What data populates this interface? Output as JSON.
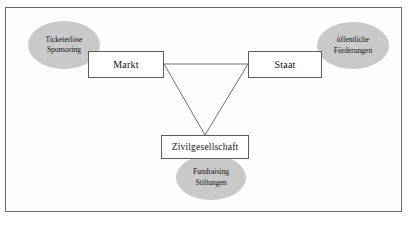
{
  "diagram": {
    "frame": {
      "border_color": "#6b6b6b",
      "background": "#fefefe"
    },
    "palette": {
      "ellipse_fill": "#c9c9c9",
      "box_stroke": "#5d5d5d",
      "box_fill": "#ffffff",
      "connector_stroke": "#6e6e6e",
      "text": "#111111"
    },
    "nodes": [
      {
        "id": "markt",
        "label": "Markt",
        "shape": "rectangle"
      },
      {
        "id": "staat",
        "label": "Staat",
        "shape": "rectangle"
      },
      {
        "id": "zivilgesellschaft",
        "label": "Zivilgesellschaft",
        "shape": "rectangle"
      }
    ],
    "sources": [
      {
        "id": "markt-sources",
        "attached_to": "markt",
        "shape": "ellipse",
        "line1": "Ticketerlöse",
        "line2": "Sponsoring"
      },
      {
        "id": "staat-sources",
        "attached_to": "staat",
        "shape": "ellipse",
        "line1": "öffentliche",
        "line2": "Förderungen"
      },
      {
        "id": "zivil-sources",
        "attached_to": "zivilgesellschaft",
        "shape": "ellipse",
        "line1": "Fundraising",
        "line2": "Stiftungen"
      }
    ],
    "connectors": [
      {
        "id": "markt-staat",
        "from": "markt",
        "to": "staat",
        "style": "solid"
      },
      {
        "id": "markt-zivilgesellschaft",
        "from": "markt",
        "to": "zivilgesellschaft",
        "style": "solid"
      },
      {
        "id": "staat-zivilgesellschaft",
        "from": "staat",
        "to": "zivilgesellschaft",
        "style": "solid"
      }
    ]
  }
}
